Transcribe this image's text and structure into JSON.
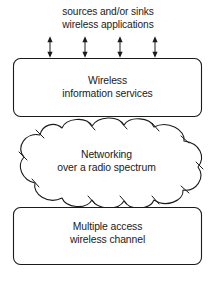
{
  "diagram": {
    "background_color": "#ffffff",
    "stroke_color": "#1b1b1b",
    "top_caption": {
      "line1": "sources and/or sinks",
      "line2": "wireless applications"
    },
    "connectors": {
      "kind": "double-headed-arrow",
      "count": 4,
      "positions_x": [
        50,
        85,
        120,
        155
      ],
      "top_y": 37,
      "bottom_y": 57
    },
    "nodes": [
      {
        "id": "wireless-information-services",
        "shape": "rounded-rectangle",
        "line1": "Wireless",
        "line2": "information services",
        "x": 13,
        "y": 58,
        "width": 189,
        "height": 59
      },
      {
        "id": "networking-radio-spectrum",
        "shape": "cloud",
        "line1": "Networking",
        "line2": "over a radio spectrum",
        "x": 8,
        "y": 120,
        "width": 197,
        "height": 86
      },
      {
        "id": "multiple-access-wireless-channel",
        "shape": "rounded-rectangle",
        "line1": "Multiple access",
        "line2": "wireless channel",
        "x": 13,
        "y": 207,
        "width": 189,
        "height": 58
      }
    ]
  }
}
